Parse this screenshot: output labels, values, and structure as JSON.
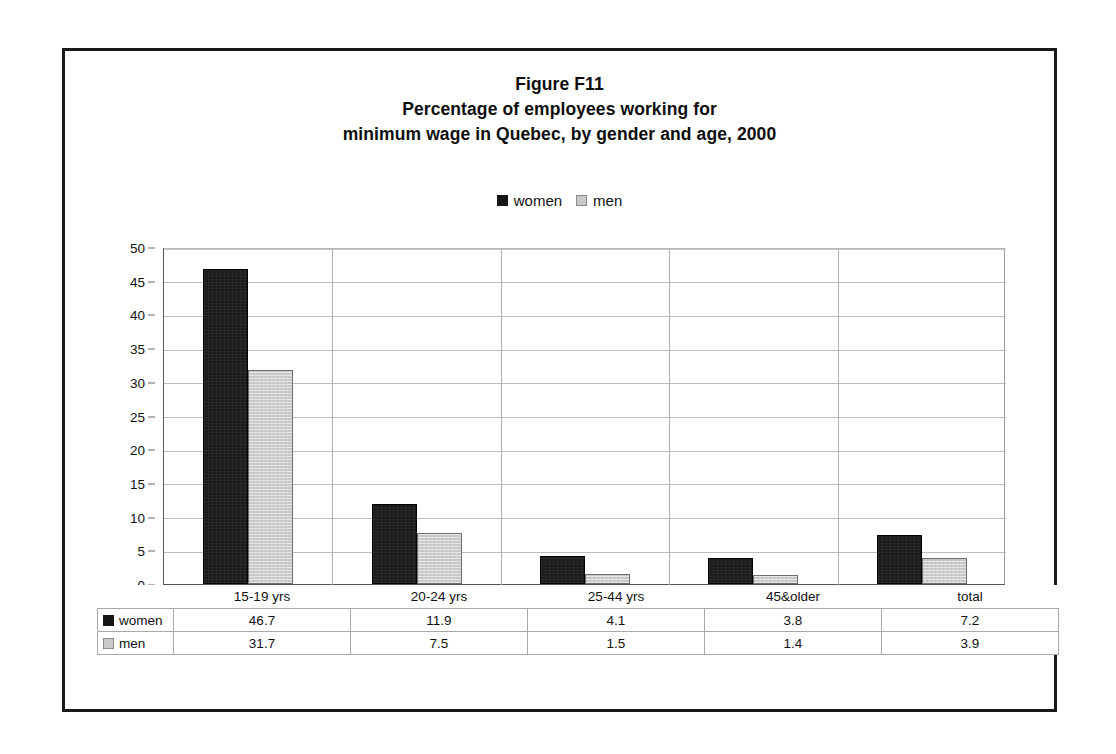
{
  "figure": {
    "title_lines": [
      "Figure F11",
      "Percentage of employees working for",
      "minimum wage in Quebec, by gender and age, 2000"
    ]
  },
  "legend": {
    "items": [
      {
        "label": "women",
        "color": "#161616",
        "swatch": "black-square-icon"
      },
      {
        "label": "men",
        "color": "#c9c9c9",
        "swatch": "gray-square-icon"
      }
    ]
  },
  "chart_data": {
    "type": "bar",
    "xlabel": "",
    "ylabel": "",
    "ylim": [
      0,
      50
    ],
    "yticks": [
      0,
      5,
      10,
      15,
      20,
      25,
      30,
      35,
      40,
      45,
      50
    ],
    "grid": true,
    "legend_position": "top-center",
    "categories": [
      "15-19 yrs",
      "20-24 yrs",
      "25-44 yrs",
      "45&older",
      "total"
    ],
    "series": [
      {
        "name": "women",
        "color": "#161616",
        "values": [
          46.7,
          11.9,
          4.1,
          3.8,
          7.2
        ]
      },
      {
        "name": "men",
        "color": "#c9c9c9",
        "values": [
          31.7,
          7.5,
          1.5,
          1.4,
          3.9
        ]
      }
    ]
  },
  "table": {
    "row_labels": [
      "women",
      "men"
    ],
    "column_headers": [
      "15-19 yrs",
      "20-24 yrs",
      "25-44 yrs",
      "45&older",
      "total"
    ],
    "rows": [
      {
        "label": "women",
        "swatch": "black-square-icon",
        "values": [
          "46.7",
          "11.9",
          "4.1",
          "3.8",
          "7.2"
        ]
      },
      {
        "label": "men",
        "swatch": "gray-square-icon",
        "values": [
          "31.7",
          "7.5",
          "1.5",
          "1.4",
          "3.9"
        ]
      }
    ]
  }
}
